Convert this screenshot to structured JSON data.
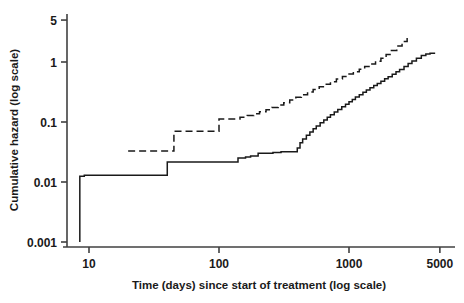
{
  "chart_data": {
    "type": "line",
    "title": "",
    "xlabel": "Time (days) since start of treatment (log scale)",
    "ylabel": "Cumulative hazard (log scale)",
    "xscale": "log",
    "yscale": "log",
    "xlim": [
      7.5,
      6000
    ],
    "ylim": [
      0.0009,
      6
    ],
    "grid": false,
    "legend": null,
    "xticks": [
      10,
      100,
      1000,
      5000
    ],
    "xticklabels": [
      "10",
      "100",
      "1000",
      "5000"
    ],
    "yticks": [
      0.001,
      0.01,
      0.1,
      1,
      5
    ],
    "yticklabels": [
      "0.001",
      "0.01",
      "0.1",
      "1",
      "5"
    ],
    "series": [
      {
        "name": "solid-curve",
        "style": "solid",
        "color": "#1a1a1a",
        "drawstyle": "steps-post",
        "x": [
          8.5,
          8.5,
          9.2,
          40,
          40,
          55,
          140,
          140,
          160,
          175,
          200,
          200,
          230,
          260,
          300,
          360,
          400,
          420,
          440,
          470,
          500,
          530,
          560,
          600,
          640,
          680,
          720,
          770,
          820,
          880,
          940,
          1000,
          1060,
          1120,
          1200,
          1280,
          1360,
          1450,
          1550,
          1650,
          1760,
          1880,
          2000,
          2150,
          2300,
          2450,
          2650,
          2850,
          3050,
          3300,
          3600,
          3900,
          4200,
          4600
        ],
        "y": [
          0.001,
          0.0125,
          0.013,
          0.013,
          0.0215,
          0.0215,
          0.0215,
          0.025,
          0.026,
          0.027,
          0.029,
          0.03,
          0.03,
          0.031,
          0.032,
          0.032,
          0.037,
          0.045,
          0.052,
          0.06,
          0.068,
          0.077,
          0.086,
          0.097,
          0.108,
          0.12,
          0.132,
          0.147,
          0.162,
          0.18,
          0.198,
          0.218,
          0.238,
          0.26,
          0.285,
          0.312,
          0.34,
          0.372,
          0.405,
          0.44,
          0.48,
          0.525,
          0.57,
          0.625,
          0.685,
          0.75,
          0.84,
          0.94,
          1.04,
          1.16,
          1.28,
          1.36,
          1.4,
          1.4
        ]
      },
      {
        "name": "dashed-curve",
        "style": "dashed",
        "color": "#1a1a1a",
        "drawstyle": "steps-post",
        "x": [
          20,
          45,
          45,
          100,
          100,
          125,
          145,
          165,
          185,
          205,
          230,
          255,
          285,
          315,
          350,
          390,
          430,
          480,
          530,
          590,
          650,
          720,
          800,
          890,
          980,
          1080,
          1200,
          1320,
          1450,
          1600,
          1760,
          1930,
          2120,
          2330,
          2560,
          2800
        ],
        "y": [
          0.033,
          0.033,
          0.07,
          0.07,
          0.112,
          0.112,
          0.12,
          0.128,
          0.137,
          0.148,
          0.16,
          0.175,
          0.192,
          0.21,
          0.232,
          0.258,
          0.285,
          0.315,
          0.348,
          0.385,
          0.425,
          0.47,
          0.52,
          0.575,
          0.63,
          0.69,
          0.76,
          0.84,
          0.93,
          1.03,
          1.15,
          1.33,
          1.56,
          1.85,
          2.2,
          2.5
        ]
      }
    ],
    "annotations": []
  }
}
